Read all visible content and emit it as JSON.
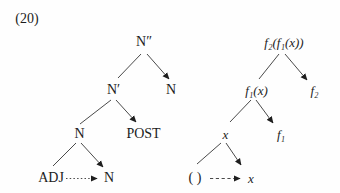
{
  "figure": {
    "number": "(20)"
  },
  "colors": {
    "text": "#1c1c1c",
    "line": "#4a4a4a",
    "arrowhead": "#1e1e1e",
    "background": "#fefefe"
  },
  "left_tree": {
    "root": "N″",
    "n_bar": "N′",
    "n_right": "N",
    "n_mid": "N",
    "post": "POST",
    "adj": "ADJ",
    "n_bottom": "N"
  },
  "right_tree": {
    "root": "f₂(f₁(x))",
    "f1_of_x": "f₁(x)",
    "f2": "f₂",
    "x_mid": "x",
    "f1": "f₁",
    "empty_slot": "( )",
    "x_bottom": "x"
  },
  "edges": {
    "left_tree": [
      {
        "from": "N″",
        "to": "N′",
        "style": "line"
      },
      {
        "from": "N″",
        "to": "N",
        "style": "arrow"
      },
      {
        "from": "N′",
        "to": "N",
        "style": "line"
      },
      {
        "from": "N′",
        "to": "POST",
        "style": "arrow"
      },
      {
        "from": "N",
        "to": "ADJ",
        "style": "line"
      },
      {
        "from": "N",
        "to": "N",
        "style": "arrow"
      },
      {
        "from": "ADJ",
        "to": "N",
        "style": "dotted-arrow"
      }
    ],
    "right_tree": [
      {
        "from": "f₂(f₁(x))",
        "to": "f₁(x)",
        "style": "line"
      },
      {
        "from": "f₂(f₁(x))",
        "to": "f₂",
        "style": "arrow"
      },
      {
        "from": "f₁(x)",
        "to": "x",
        "style": "line"
      },
      {
        "from": "f₁(x)",
        "to": "f₁",
        "style": "arrow"
      },
      {
        "from": "x",
        "to": "( )",
        "style": "line"
      },
      {
        "from": "x",
        "to": "x",
        "style": "arrow"
      },
      {
        "from": "( )",
        "to": "x",
        "style": "dashed-arrow"
      }
    ]
  }
}
